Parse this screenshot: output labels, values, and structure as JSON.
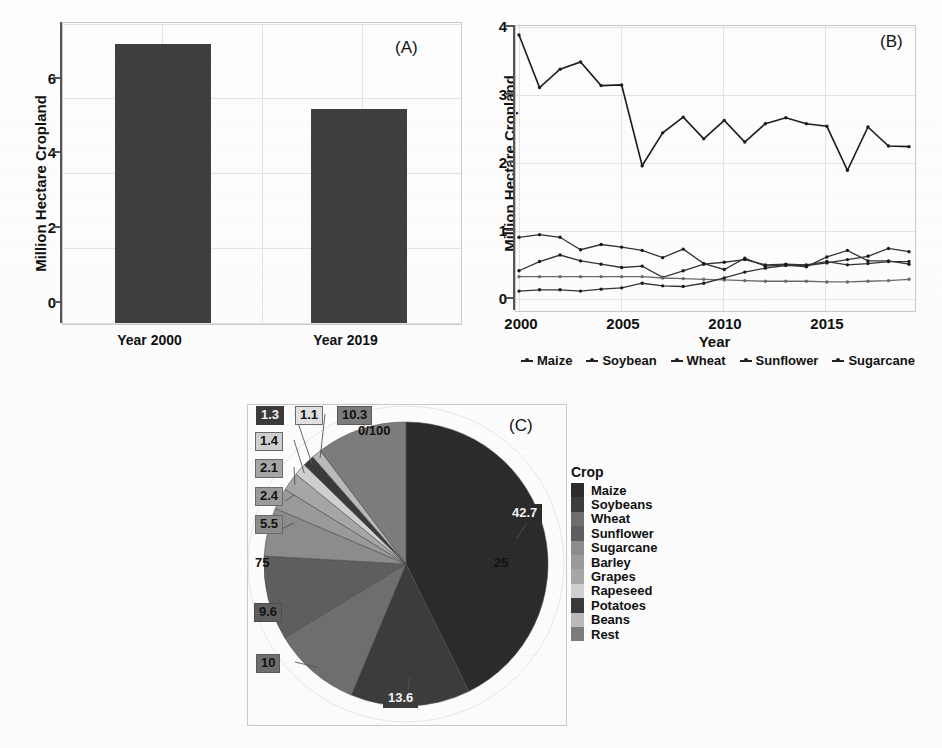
{
  "figure": {
    "panel_a_tag": "(A)",
    "panel_b_tag": "(B)",
    "panel_c_tag": "(C)"
  },
  "chart_data": [
    {
      "id": "panel_a",
      "type": "bar",
      "title": "",
      "panel_label": "(A)",
      "xlabel": "",
      "ylabel": "Million Hectare Cropland",
      "categories": [
        "Year 2000",
        "Year 2019"
      ],
      "values": [
        6.9,
        5.3
      ],
      "ylim": [
        0,
        7.4
      ],
      "yticks": [
        "0",
        "2",
        "4",
        "6"
      ],
      "ytick_values": [
        0,
        2,
        4,
        6
      ],
      "grid": true,
      "bar_color": "#3f3f3f"
    },
    {
      "id": "panel_b",
      "type": "line",
      "title": "",
      "panel_label": "(B)",
      "xlabel": "Year",
      "ylabel": "Million Hectare Cropland",
      "x": [
        2000,
        2001,
        2002,
        2003,
        2004,
        2005,
        2006,
        2007,
        2008,
        2009,
        2010,
        2011,
        2012,
        2013,
        2014,
        2015,
        2016,
        2017,
        2018,
        2019
      ],
      "xticks": [
        "2000",
        "2005",
        "2010",
        "2015"
      ],
      "xtick_values": [
        2000,
        2005,
        2010,
        2015
      ],
      "yticks": [
        "0",
        "1",
        "2",
        "3",
        "4"
      ],
      "ytick_values": [
        0,
        1,
        2,
        3,
        4
      ],
      "xlim": [
        2000,
        2019
      ],
      "ylim": [
        0,
        4.15
      ],
      "grid": true,
      "legend_position": "bottom",
      "series": [
        {
          "name": "Maize",
          "values": [
            4.02,
            3.22,
            3.5,
            3.61,
            3.25,
            3.26,
            2.03,
            2.53,
            2.77,
            2.44,
            2.72,
            2.39,
            2.67,
            2.76,
            2.67,
            2.63,
            1.96,
            2.62,
            2.33,
            2.32
          ]
        },
        {
          "name": "Soybean",
          "values": [
            0.94,
            0.98,
            0.94,
            0.75,
            0.83,
            0.79,
            0.74,
            0.63,
            0.76,
            0.54,
            0.45,
            0.62,
            0.5,
            0.52,
            0.49,
            0.64,
            0.74,
            0.58,
            0.58,
            0.53
          ]
        },
        {
          "name": "Wheat",
          "values": [
            0.43,
            0.57,
            0.67,
            0.58,
            0.53,
            0.48,
            0.5,
            0.33,
            0.43,
            0.53,
            0.56,
            0.6,
            0.52,
            0.53,
            0.52,
            0.57,
            0.52,
            0.54,
            0.57,
            0.57
          ]
        },
        {
          "name": "Sunflower",
          "values": [
            0.34,
            0.34,
            0.34,
            0.34,
            0.34,
            0.34,
            0.34,
            0.32,
            0.31,
            0.3,
            0.29,
            0.28,
            0.27,
            0.27,
            0.27,
            0.26,
            0.26,
            0.27,
            0.28,
            0.3
          ]
        },
        {
          "name": "Sugarcane",
          "values": [
            0.12,
            0.14,
            0.14,
            0.12,
            0.15,
            0.17,
            0.24,
            0.2,
            0.19,
            0.24,
            0.32,
            0.41,
            0.47,
            0.51,
            0.51,
            0.55,
            0.6,
            0.65,
            0.77,
            0.72
          ]
        }
      ]
    },
    {
      "id": "panel_c",
      "type": "pie",
      "title": "",
      "panel_label": "(C)",
      "legend_title": "Crop",
      "legend_position": "right",
      "axis_tick_labels": [
        "0/100",
        "25",
        "75"
      ],
      "start_angle_top": true,
      "direction": "clockwise",
      "labels": [
        "Maize",
        "Soybeans",
        "Wheat",
        "Sunflower",
        "Sugarcane",
        "Barley",
        "Grapes",
        "Rapeseed",
        "Potatoes",
        "Beans",
        "Rest"
      ],
      "values": [
        42.7,
        13.6,
        10,
        9.6,
        5.5,
        2.4,
        2.1,
        1.4,
        1.3,
        1.1,
        10.3
      ],
      "value_labels": [
        "42.7",
        "13.6",
        "10",
        "9.6",
        "5.5",
        "2.4",
        "2.1",
        "1.4",
        "1.3",
        "1.1",
        "10.3"
      ],
      "colors": [
        "#2b2b2b",
        "#3c3c3c",
        "#6e6e6e",
        "#5e5e5e",
        "#8c8c8c",
        "#9a9a9a",
        "#a6a6a6",
        "#cfcfcf",
        "#3a3a3a",
        "#b9b9b9",
        "#7c7c7c"
      ],
      "label_text_colors": [
        "#f2f2f2",
        "#f2f2f2",
        "#111111",
        "#111111",
        "#111111",
        "#111111",
        "#111111",
        "#111111",
        "#f2f2f2",
        "#111111",
        "#111111"
      ]
    }
  ]
}
